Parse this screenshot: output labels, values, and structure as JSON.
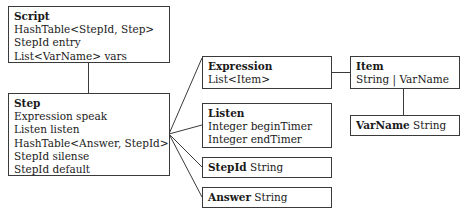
{
  "diagram": {
    "boxes": {
      "script": {
        "title": "Script",
        "fields": [
          "HashTable<StepId, Step>",
          "StepId entry",
          "List<VarName> vars"
        ]
      },
      "step": {
        "title": "Step",
        "fields": [
          "Expression speak",
          "Listen listen",
          "HashTable<Answer, StepId>",
          "StepId silense",
          "StepId default"
        ]
      },
      "expression": {
        "title": "Expression",
        "fields": [
          "List<Item>"
        ]
      },
      "listen": {
        "title": "Listen",
        "fields": [
          "Integer beginTimer",
          "Integer endTimer"
        ]
      },
      "stepid": {
        "title": "StepId",
        "type": "String"
      },
      "answer": {
        "title": "Answer",
        "type": "String"
      },
      "item": {
        "title": "Item",
        "fields": [
          "String | VarName"
        ]
      },
      "varname": {
        "title": "VarName",
        "type": "String"
      }
    },
    "connections": [
      [
        "Script",
        "Step"
      ],
      [
        "Step",
        "Expression"
      ],
      [
        "Step",
        "Listen"
      ],
      [
        "Step",
        "StepId"
      ],
      [
        "Step",
        "Answer"
      ],
      [
        "Expression",
        "Item"
      ],
      [
        "Item",
        "VarName"
      ]
    ],
    "line_color": "#3a3a3a"
  }
}
